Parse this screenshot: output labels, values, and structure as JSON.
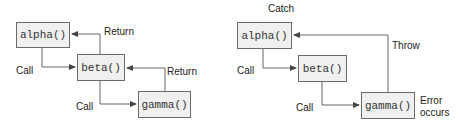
{
  "left_diagram": {
    "nodes": {
      "alpha": "alpha()",
      "beta": "beta()",
      "gamma": "gamma()"
    },
    "labels": {
      "call_1": "Call",
      "call_2": "Call",
      "return_1": "Return",
      "return_2": "Return"
    }
  },
  "right_diagram": {
    "nodes": {
      "alpha": "alpha()",
      "beta": "beta()",
      "gamma": "gamma()"
    },
    "labels": {
      "catch": "Catch",
      "throw": "Throw",
      "call_1": "Call",
      "call_2": "Call",
      "error_line1": "Error",
      "error_line2": "occurs"
    }
  },
  "colors": {
    "box_fill": "#f0f0f0",
    "box_border": "#6a6a6a",
    "arrow": "#555555"
  }
}
